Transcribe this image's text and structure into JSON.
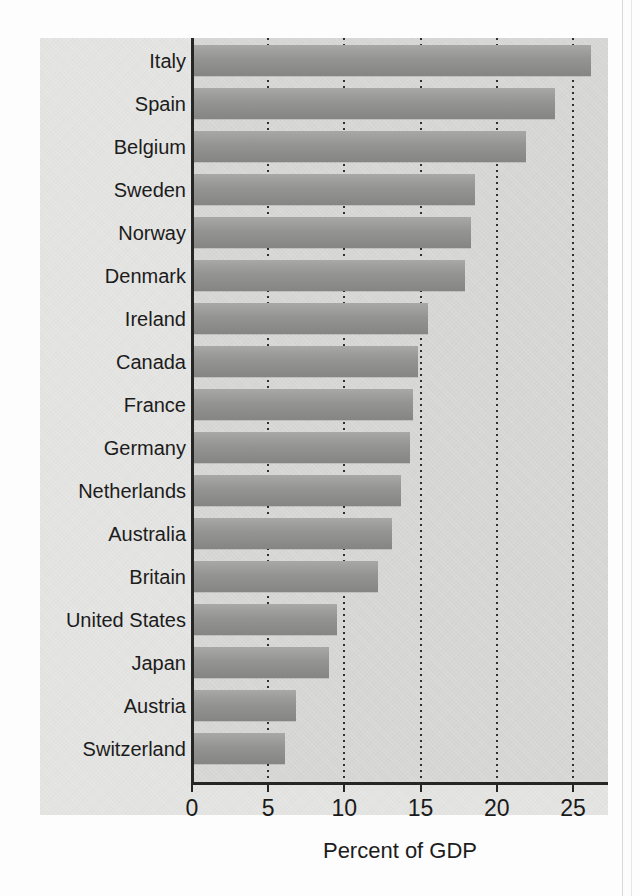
{
  "chart_data": {
    "type": "bar",
    "orientation": "horizontal",
    "title": "",
    "subtitle": "",
    "xlabel": "Percent of GDP",
    "ylabel": "",
    "xlim": [
      0,
      27.3
    ],
    "xticks": [
      0,
      5,
      10,
      15,
      20,
      25
    ],
    "xtick_labels": [
      "0",
      "5",
      "10",
      "15",
      "20",
      "25"
    ],
    "grid": "vertical-dotted",
    "legend": null,
    "categories": [
      "Italy",
      "Spain",
      "Belgium",
      "Sweden",
      "Norway",
      "Denmark",
      "Ireland",
      "Canada",
      "France",
      "Germany",
      "Netherlands",
      "Australia",
      "Britain",
      "United States",
      "Japan",
      "Austria",
      "Switzerland"
    ],
    "values": [
      26.2,
      23.8,
      21.9,
      18.6,
      18.3,
      17.9,
      15.5,
      14.8,
      14.5,
      14.3,
      13.7,
      13.1,
      12.2,
      9.5,
      9.0,
      6.8,
      6.1
    ]
  },
  "axis": {
    "x_title": "Percent of GDP"
  },
  "colors": {
    "bar_fill": "#949492",
    "panel_background": "#e3e3e1",
    "plot_background": "#d6d6d4",
    "axis_line": "#262626",
    "gridline": "#303030",
    "text": "#1c1c1c"
  }
}
